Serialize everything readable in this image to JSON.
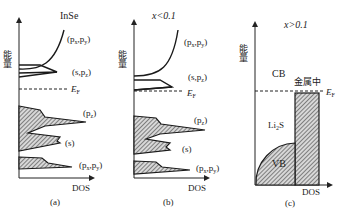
{
  "figure": {
    "y_axis_label": "能量",
    "x_axis_label": "DOS",
    "fermi_label": "E",
    "fermi_sub": "F",
    "panels": [
      {
        "id": "a",
        "title": "InSe",
        "caption": "(a)",
        "bands": [
          {
            "label": "(px,py)",
            "text": "(p",
            "kind": "conduction"
          },
          {
            "label": "(s,pz)",
            "kind": "conduction"
          },
          {
            "label": "(pz)",
            "kind": "valence"
          },
          {
            "label": "(s)",
            "kind": "valence"
          },
          {
            "label": "(px,py)",
            "kind": "valence"
          }
        ]
      },
      {
        "id": "b",
        "title": "x<0.1",
        "caption": "(b)",
        "bands": [
          {
            "label": "(px,py)",
            "kind": "conduction"
          },
          {
            "label": "(s,pz)",
            "kind": "conduction"
          },
          {
            "label": "(pz)",
            "kind": "valence"
          },
          {
            "label": "(s)",
            "kind": "valence"
          },
          {
            "label": "(px,py)",
            "kind": "valence"
          }
        ]
      },
      {
        "id": "c",
        "title": "x>0.1",
        "caption": "(c)",
        "labels": {
          "cb": "CB",
          "metal": "金属中",
          "li2s": "Li",
          "li2s_sub": "2",
          "li2s_tail": "S",
          "vb": "VB"
        }
      }
    ]
  },
  "text": {
    "a_title": "InSe",
    "b_title": "x<0.1",
    "c_title": "x>0.1",
    "a_caption": "(a)",
    "b_caption": "(b)",
    "c_caption": "(c)",
    "dos": "DOS",
    "energy": "能量",
    "cb": "CB",
    "vb": "VB",
    "metal": "金属中"
  }
}
